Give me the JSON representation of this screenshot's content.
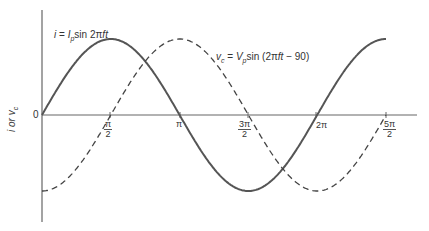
{
  "chart_data": {
    "type": "line",
    "title": "",
    "xlabel": "",
    "ylabel": "i or v_c",
    "x_tick_labels": [
      "π/2",
      "π",
      "3π/2",
      "2π",
      "5π/2"
    ],
    "x_tick_values_rad": [
      1.5708,
      3.1416,
      4.7124,
      6.2832,
      7.854
    ],
    "x_range_rad": [
      0,
      8.3
    ],
    "y_origin_label": "0",
    "grid": false,
    "series": [
      {
        "name": "i = I_p sin 2πft",
        "style": "solid",
        "x": [
          0,
          0.7854,
          1.5708,
          2.3562,
          3.1416,
          3.927,
          4.7124,
          5.4978,
          6.2832,
          7.0686,
          7.854
        ],
        "y": [
          0,
          0.707,
          1,
          0.707,
          0,
          -0.707,
          -1,
          -0.707,
          0,
          0.707,
          1
        ]
      },
      {
        "name": "v_c = V_p sin (2πft − 90)",
        "style": "dashed",
        "x": [
          0,
          0.7854,
          1.5708,
          2.3562,
          3.1416,
          3.927,
          4.7124,
          5.4978,
          6.2832,
          7.0686,
          7.854
        ],
        "y": [
          -1,
          -0.707,
          0,
          0.707,
          1,
          0.707,
          0,
          -0.707,
          -1,
          -0.707,
          0
        ]
      }
    ],
    "annotations": [
      {
        "text": "i = I_p sin 2πft",
        "attached_to": "solid curve"
      },
      {
        "text": "v_c = V_p sin (2πft − 90)",
        "attached_to": "dashed curve"
      }
    ]
  },
  "labels": {
    "current_eq": {
      "lhs": "i",
      "eq": " = ",
      "var": "I",
      "sub": "p",
      "rest": "sin 2π",
      "ft": "ft"
    },
    "voltage_eq": {
      "lhs": "v",
      "lhs_sub": "c",
      "eq": " = ",
      "var": "V",
      "sub": "p",
      "rest": "sin (2π",
      "ft": "ft",
      "tail": " − 90)"
    },
    "y_axis": "i or v",
    "y_axis_sub": "c",
    "origin": "0",
    "ticks": [
      {
        "num": "π",
        "den": "2"
      },
      {
        "single": "π"
      },
      {
        "num": "3π",
        "den": "2"
      },
      {
        "single": "2π"
      },
      {
        "num": "5π",
        "den": "2"
      }
    ]
  },
  "colors": {
    "axis": "#666666",
    "curve": "#555555",
    "text": "#333333"
  }
}
